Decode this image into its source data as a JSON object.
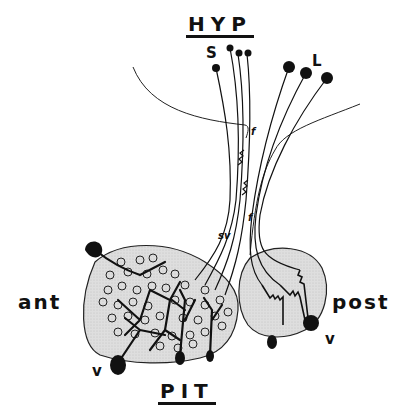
{
  "diagram": {
    "title_top": "HYP",
    "title_bottom": "PIT",
    "label_left": "ant",
    "label_right": "post",
    "label_small_cells": "S",
    "label_large_cells": "L",
    "label_vessel_left": "v",
    "label_vessel_right": "v",
    "label_fiber_upper": "f",
    "label_fiber_lower": "f",
    "label_sv": "sv",
    "colors": {
      "ink": "#111111",
      "lobe_fill": "#dcdcdc",
      "background": "#ffffff"
    }
  }
}
